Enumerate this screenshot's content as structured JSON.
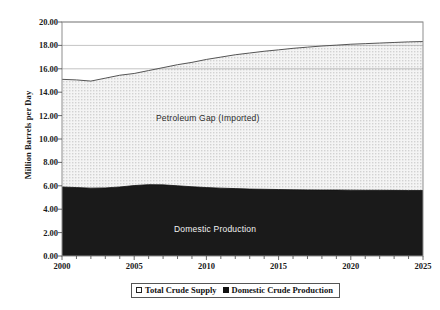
{
  "chart_data": {
    "type": "area",
    "title": "",
    "xlabel": "",
    "ylabel": "Million Barrels per Day",
    "xlim": [
      2000,
      2025
    ],
    "ylim": [
      0,
      20
    ],
    "ytick_step": 2,
    "ytick_labels": [
      "20.00",
      "18.00",
      "16.00",
      "14.00",
      "12.00",
      "10.00",
      "8.00",
      "6.00",
      "4.00",
      "2.00",
      "0.00"
    ],
    "ytick_values": [
      20,
      18,
      16,
      14,
      12,
      10,
      8,
      6,
      4,
      2,
      0
    ],
    "xtick_labels": [
      "2000",
      "2005",
      "2010",
      "2015",
      "2020",
      "2025"
    ],
    "xtick_values": [
      2000,
      2005,
      2010,
      2015,
      2020,
      2025
    ],
    "minor_xticks_every": 1,
    "grid": "horizontal-partial",
    "legend_position": "below-axis-center",
    "x": [
      2000,
      2001,
      2002,
      2003,
      2004,
      2005,
      2006,
      2007,
      2008,
      2009,
      2010,
      2011,
      2012,
      2013,
      2014,
      2015,
      2016,
      2017,
      2018,
      2019,
      2020,
      2021,
      2022,
      2023,
      2024,
      2025
    ],
    "series": [
      {
        "name": "Total Crude Supply",
        "marker": "open-square",
        "fill": "dotted-light",
        "values": [
          15.1,
          15.05,
          14.95,
          15.2,
          15.45,
          15.6,
          15.85,
          16.1,
          16.35,
          16.55,
          16.8,
          17.0,
          17.2,
          17.35,
          17.5,
          17.62,
          17.75,
          17.85,
          17.95,
          18.02,
          18.1,
          18.15,
          18.2,
          18.25,
          18.3,
          18.33
        ]
      },
      {
        "name": "Domestic Crude Production",
        "marker": "filled-square",
        "fill": "solid-dark",
        "values": [
          5.9,
          5.85,
          5.8,
          5.82,
          5.9,
          6.02,
          6.1,
          6.08,
          6.0,
          5.92,
          5.85,
          5.8,
          5.76,
          5.72,
          5.7,
          5.68,
          5.66,
          5.65,
          5.64,
          5.64,
          5.63,
          5.62,
          5.62,
          5.61,
          5.6,
          5.6
        ]
      }
    ],
    "band_labels": [
      {
        "text": "Petroleum Gap (Imported)",
        "region": "between-series"
      },
      {
        "text": "Domestic Production",
        "region": "lower-series"
      }
    ],
    "colors": {
      "gap_fill": "#ebebeb",
      "domestic_fill": "#1a1a1a",
      "line": "#555555",
      "axis": "#666666",
      "text": "#1a1a1a",
      "gap_label_text": "#2b2b2b",
      "domestic_label_text": "#f2f2f2"
    }
  },
  "legend": {
    "items": [
      {
        "label": "Total Crude Supply",
        "marker": "open-square"
      },
      {
        "label": "Domestic Crude Production",
        "marker": "filled-square"
      }
    ]
  },
  "axis": {
    "y_title": "Million Barrels per Day"
  },
  "annotations": {
    "gap_label": "Petroleum Gap (Imported)",
    "domestic_label": "Domestic Production"
  }
}
